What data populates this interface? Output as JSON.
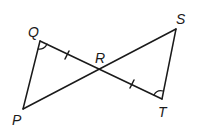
{
  "diagram": {
    "type": "geometry",
    "points": {
      "P": {
        "label": "P",
        "x": 23,
        "y": 109
      },
      "Q": {
        "label": "Q",
        "x": 40,
        "y": 41
      },
      "R": {
        "label": "R",
        "x": 100,
        "y": 70
      },
      "S": {
        "label": "S",
        "x": 176,
        "y": 29
      },
      "T": {
        "label": "T",
        "x": 162,
        "y": 99
      }
    },
    "segments": [
      "PQ",
      "QT",
      "PS",
      "ST"
    ],
    "marks": {
      "congruent_segments": [
        "QR",
        "RT"
      ],
      "congruent_angles": [
        "angle Q",
        "angle T"
      ]
    },
    "colors": {
      "stroke": "#1a1a1a",
      "background": "#ffffff"
    }
  }
}
